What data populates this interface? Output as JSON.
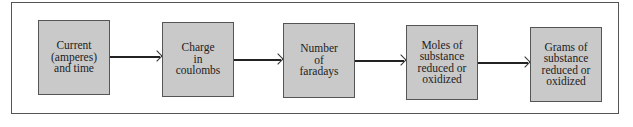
{
  "diagram": {
    "type": "flowchart",
    "direction": "left-to-right",
    "colors": {
      "box_fill": "#c9c9c9",
      "box_border": "#555555",
      "arrow": "#222222",
      "frame": "#555555"
    },
    "nodes": [
      {
        "id": "current",
        "label": "Current\n(amperes)\nand time"
      },
      {
        "id": "charge",
        "label": "Charge\nin\ncoulombs"
      },
      {
        "id": "faradays",
        "label": "Number\nof\nfaradays"
      },
      {
        "id": "moles",
        "label": "Moles of\nsubstance\nreduced or\noxidized"
      },
      {
        "id": "grams",
        "label": "Grams of\nsubstance\nreduced or\noxidized"
      }
    ],
    "edges": [
      {
        "from": "current",
        "to": "charge"
      },
      {
        "from": "charge",
        "to": "faradays"
      },
      {
        "from": "faradays",
        "to": "moles"
      },
      {
        "from": "moles",
        "to": "grams"
      }
    ]
  }
}
